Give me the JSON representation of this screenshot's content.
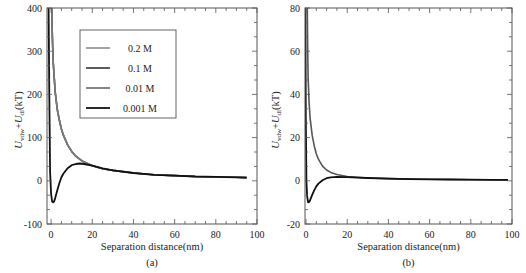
{
  "chart_data": [
    {
      "panel": "(a)",
      "type": "line",
      "title": "",
      "caption": "(a)",
      "xlabel": "Separation distance(nm)",
      "ylabel": {
        "main": "U",
        "sub1": "vdw",
        "plus": "+",
        "main2": "U",
        "sub2": "dl",
        "unit": "(kT)"
      },
      "xlim": [
        -2,
        100
      ],
      "ylim": [
        -100,
        400
      ],
      "xticks": [
        0,
        20,
        40,
        60,
        80,
        100
      ],
      "yticks": [
        -100,
        0,
        100,
        200,
        300,
        400
      ],
      "grid": false,
      "legend_position": "upper-center",
      "series": [
        {
          "name": "0.2 M",
          "color": "#9a9a9a",
          "x": [
            0.3,
            0.6,
            1,
            2,
            3,
            4,
            5,
            6,
            8,
            10,
            12,
            15,
            20,
            25,
            30,
            40,
            50,
            60,
            70,
            80,
            90,
            95
          ],
          "y": [
            400,
            330,
            275,
            205,
            165,
            140,
            120,
            105,
            83,
            68,
            57,
            46,
            35,
            28,
            24,
            18,
            14,
            12,
            10,
            9,
            8,
            7.5
          ]
        },
        {
          "name": "0.1 M",
          "color": "#4a4a4a",
          "x": [
            0.3,
            0.6,
            1,
            2,
            3,
            4,
            5,
            6,
            8,
            10,
            12,
            15,
            20,
            25,
            30,
            40,
            50,
            60,
            70,
            80,
            90,
            95
          ],
          "y": [
            400,
            330,
            275,
            205,
            165,
            140,
            120,
            105,
            83,
            68,
            57,
            46,
            35,
            28,
            24,
            18,
            14,
            12,
            10,
            9,
            8,
            7.5
          ]
        },
        {
          "name": "0.01 M",
          "color": "#7a7a7a",
          "x": [
            0.3,
            0.6,
            1,
            2,
            3,
            4,
            5,
            6,
            8,
            10,
            12,
            15,
            20,
            25,
            30,
            40,
            50,
            60,
            70,
            80,
            90,
            95
          ],
          "y": [
            400,
            330,
            275,
            205,
            165,
            140,
            120,
            105,
            83,
            68,
            57,
            46,
            35,
            28,
            24,
            18,
            14,
            12,
            10,
            9,
            8,
            7.5
          ]
        },
        {
          "name": "0.001 M",
          "color": "#111111",
          "x": [
            -1.2,
            -0.9,
            -0.5,
            0,
            0.5,
            1,
            1.5,
            2,
            3,
            4,
            5,
            6,
            8,
            10,
            12,
            14,
            16,
            20,
            25,
            30,
            40,
            50,
            60,
            70,
            80,
            90,
            95
          ],
          "y": [
            400,
            200,
            20,
            -30,
            -48,
            -50,
            -47,
            -40,
            -22,
            -5,
            8,
            17,
            29,
            36,
            39,
            40,
            39,
            35,
            29,
            24,
            18,
            14,
            12,
            10,
            9,
            8,
            7.5
          ]
        }
      ],
      "legend": [
        "0.2 M",
        "0.1 M",
        "0.01 M",
        "0.001 M"
      ]
    },
    {
      "panel": "(b)",
      "type": "line",
      "title": "",
      "caption": "(b)",
      "xlabel": "Separation distance(nm)",
      "ylabel": {
        "main": "U",
        "sub1": "vdw",
        "plus": "+",
        "main2": "U",
        "sub2": "dl",
        "unit": "(kT)"
      },
      "xlim": [
        -0.5,
        100
      ],
      "ylim": [
        -20,
        80
      ],
      "xticks": [
        0,
        20,
        40,
        60,
        80,
        100
      ],
      "yticks": [
        -20,
        0,
        20,
        40,
        60,
        80
      ],
      "grid": false,
      "series": [
        {
          "name": "upper",
          "color": "#555555",
          "x": [
            0.6,
            0.8,
            1,
            1.5,
            2,
            3,
            4,
            5,
            6,
            8,
            10,
            12,
            15,
            20,
            25,
            30,
            40,
            50,
            60,
            70,
            80,
            90,
            98
          ],
          "y": [
            80,
            60,
            48,
            36,
            29,
            21,
            16,
            12.5,
            10,
            6.8,
            5,
            3.9,
            2.9,
            2,
            1.6,
            1.3,
            1,
            0.8,
            0.7,
            0.6,
            0.5,
            0.45,
            0.4
          ]
        },
        {
          "name": "lower",
          "color": "#111111",
          "x": [
            -0.3,
            -0.1,
            0.2,
            0.5,
            1,
            1.5,
            2,
            3,
            4,
            5,
            6,
            8,
            10,
            12,
            15,
            20,
            25,
            30,
            40,
            50,
            60,
            70,
            80,
            90,
            98
          ],
          "y": [
            80,
            30,
            0,
            -7,
            -10,
            -9.8,
            -9,
            -6.5,
            -4.3,
            -2.6,
            -1.3,
            0.3,
            1.2,
            1.6,
            1.8,
            1.7,
            1.5,
            1.3,
            1,
            0.8,
            0.7,
            0.6,
            0.5,
            0.45,
            0.4
          ]
        }
      ]
    }
  ]
}
